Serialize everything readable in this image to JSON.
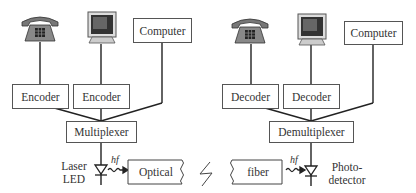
{
  "diagram": {
    "type": "optical-communication-multiplexing",
    "transmitter": {
      "sources": [
        {
          "icon": "telephone-icon"
        },
        {
          "icon": "computer-monitor-icon"
        },
        {
          "label": "Computer"
        }
      ],
      "encoders": [
        "Encoder",
        "Encoder"
      ],
      "multiplexer": "Multiplexer",
      "emitter_label_1": "Laser",
      "emitter_label_2": "LED",
      "photon_label": "hf",
      "fiber_left": "Optical"
    },
    "receiver": {
      "sinks": [
        {
          "icon": "telephone-icon"
        },
        {
          "icon": "computer-monitor-icon"
        },
        {
          "label": "Computer"
        }
      ],
      "decoders": [
        "Decoder",
        "Decoder"
      ],
      "demultiplexer": "Demultiplexer",
      "detector_label_1": "Photo-",
      "detector_label_2": "detector",
      "photon_label": "hf",
      "fiber_right": "fiber"
    },
    "break_symbol": "lightning-break"
  }
}
